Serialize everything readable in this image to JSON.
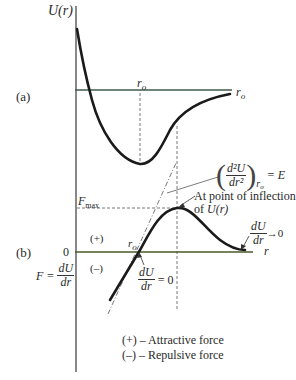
{
  "figure": {
    "panel_a": {
      "label": "(a)",
      "y_axis_label": "U(r)",
      "r_o_top_label": "r",
      "r_o_top_sub": "o",
      "r_o_right_label": "r",
      "r_o_right_sub": "o"
    },
    "panel_b": {
      "label": "(b)",
      "zero_label": "0",
      "force_lhs": "F =",
      "force_num": "dU",
      "force_den": "dr",
      "f_max": "F",
      "f_max_sub": "max",
      "plus_region": "(+)",
      "minus_region": "(–)",
      "r_o_label": "r",
      "r_o_sub": "o",
      "x_axis_label": "r",
      "du_dr_zero_num": "dU",
      "du_dr_zero_den": "dr",
      "du_dr_zero_eq": "= 0",
      "du_dr_limit_num": "dU",
      "du_dr_limit_den": "dr",
      "du_dr_limit_arrow": "→0",
      "second_deriv_num": "d²U",
      "second_deriv_den": "dr²",
      "second_deriv_sub": "r",
      "second_deriv_sub2": "o",
      "second_deriv_eq": "= E",
      "inflection_line1": "At point of inflection",
      "inflection_line2_prefix": "of ",
      "inflection_line2_fn": "U(r)",
      "legend": [
        "(+) – Attractive force",
        "(–) – Repulsive force"
      ]
    },
    "colors": {
      "curve": "#1a1a1a",
      "axis": "#3a3a3a",
      "a_axis_line": "#3f5a4a",
      "b_axis_line": "#4a5a2a",
      "dashed": "#555555",
      "text": "#2a2a2a"
    }
  }
}
